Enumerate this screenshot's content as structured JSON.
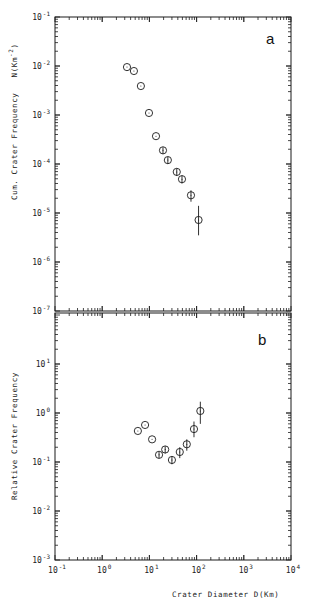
{
  "chart_data": [
    {
      "type": "scatter",
      "panel_label": "a",
      "title": "",
      "xlabel": "Crater Diameter D(Km)",
      "ylabel": "Cum. Crater Frequency   N(Km^-2)",
      "xscale": "log",
      "yscale": "log",
      "xlim": [
        0.1,
        10000
      ],
      "ylim": [
        1e-07,
        0.1
      ],
      "x_ticks": [
        "10^-1",
        "10^0",
        "10^1",
        "10^2",
        "10^3",
        "10^4"
      ],
      "y_ticks": [
        "10^-7",
        "10^-6",
        "10^-5",
        "10^-4",
        "10^-3",
        "10^-2",
        "10^-1"
      ],
      "grid": false,
      "marker": "open circle with error bar",
      "series": [
        {
          "name": "cumulative",
          "x": [
            3.35,
            4.7,
            6.6,
            9.8,
            13.8,
            19.4,
            24.6,
            38,
            49,
            76,
            110
          ],
          "y": [
            0.0095,
            0.0079,
            0.0039,
            0.0011,
            0.00037,
            0.00019,
            0.00012,
            6.9e-05,
            4.9e-05,
            2.3e-05,
            7.2e-06
          ],
          "err_low": [
            0,
            0,
            0,
            0,
            0,
            3e-05,
            2e-05,
            1.2e-05,
            9e-06,
            6e-06,
            3.7e-06
          ],
          "err_high": [
            0,
            0,
            0,
            0,
            0,
            3e-05,
            2e-05,
            1.2e-05,
            9e-06,
            6e-06,
            6.8e-06
          ]
        }
      ]
    },
    {
      "type": "scatter",
      "panel_label": "b",
      "title": "",
      "xlabel": "Crater Diameter D(Km)",
      "ylabel": "Relative Crater Frequency",
      "xscale": "log",
      "yscale": "log",
      "xlim": [
        0.1,
        10000
      ],
      "ylim": [
        0.001,
        100
      ],
      "x_ticks": [
        "10^-1",
        "10^0",
        "10^1",
        "10^2",
        "10^3",
        "10^4"
      ],
      "y_ticks": [
        "10^-3",
        "10^-2",
        "10^-1",
        "10^0",
        "10^1"
      ],
      "grid": false,
      "marker": "open circle with error bar",
      "series": [
        {
          "name": "relative (R)",
          "x": [
            5.7,
            8.1,
            11.4,
            16,
            21.6,
            30,
            44,
            62,
            88,
            120
          ],
          "y": [
            0.43,
            0.57,
            0.29,
            0.14,
            0.18,
            0.11,
            0.16,
            0.23,
            0.47,
            1.1
          ],
          "err_low": [
            0,
            0,
            0,
            0.02,
            0.03,
            0.02,
            0.04,
            0.06,
            0.15,
            0.5
          ],
          "err_high": [
            0,
            0,
            0,
            0.02,
            0.03,
            0.02,
            0.04,
            0.06,
            0.2,
            0.6
          ]
        }
      ]
    }
  ],
  "figure": {
    "top_ylabel_main": "Cum. Crater Frequency",
    "top_ylabel_unit": "N(Km",
    "top_ylabel_unit_exp": "-2",
    "top_ylabel_unit_close": ")",
    "bottom_ylabel": "Relative Crater Frequency",
    "xlabel": "Crater Diameter D(Km)",
    "panel_a": "a",
    "panel_b": "b",
    "top_yticks": [
      {
        "base": "10",
        "exp": "-1"
      },
      {
        "base": "10",
        "exp": "-2"
      },
      {
        "base": "10",
        "exp": "-3"
      },
      {
        "base": "10",
        "exp": "-4"
      },
      {
        "base": "10",
        "exp": "-5"
      },
      {
        "base": "10",
        "exp": "-6"
      },
      {
        "base": "10",
        "exp": "-7"
      }
    ],
    "bottom_yticks": [
      {
        "base": "10",
        "exp": "1"
      },
      {
        "base": "10",
        "exp": "0"
      },
      {
        "base": "10",
        "exp": "-1"
      },
      {
        "base": "10",
        "exp": "-2"
      },
      {
        "base": "10",
        "exp": "-3"
      }
    ],
    "xticks": [
      {
        "base": "10",
        "exp": "-1"
      },
      {
        "base": "10",
        "exp": "0"
      },
      {
        "base": "10",
        "exp": "1"
      },
      {
        "base": "10",
        "exp": "2"
      },
      {
        "base": "10",
        "exp": "3"
      },
      {
        "base": "10",
        "exp": "4"
      }
    ],
    "colors": {
      "ink": "#1a1a1a",
      "background": "#ffffff"
    }
  }
}
